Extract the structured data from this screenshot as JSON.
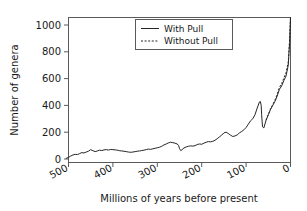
{
  "chart_data": {
    "type": "line",
    "title": "",
    "xlabel": "Millions of years before present",
    "ylabel": "Number of genera",
    "xlim": [
      500,
      0
    ],
    "ylim": [
      0,
      1060
    ],
    "x_ticks": [
      500,
      400,
      300,
      200,
      100,
      0
    ],
    "x_tick_labels": [
      "500",
      "400",
      "300",
      "200",
      "100",
      "0"
    ],
    "y_ticks": [
      0,
      200,
      400,
      600,
      800,
      1000
    ],
    "y_tick_labels": [
      "0",
      "200",
      "400",
      "600",
      "800",
      "1000"
    ],
    "x_axis_reversed": true,
    "grid": false,
    "legend_position": "top-center",
    "legend_entries": [
      "With Pull",
      "Without Pull"
    ],
    "series": [
      {
        "name": "With Pull",
        "style": "solid",
        "x": [
          505,
          500,
          495,
          490,
          485,
          480,
          475,
          470,
          465,
          460,
          455,
          450,
          445,
          440,
          435,
          430,
          425,
          420,
          415,
          410,
          405,
          400,
          395,
          390,
          385,
          380,
          375,
          370,
          365,
          360,
          355,
          350,
          345,
          340,
          335,
          330,
          325,
          320,
          315,
          310,
          305,
          300,
          295,
          290,
          285,
          280,
          275,
          270,
          265,
          260,
          255,
          252,
          250,
          247,
          245,
          240,
          235,
          230,
          225,
          220,
          215,
          210,
          205,
          200,
          195,
          190,
          185,
          180,
          175,
          170,
          165,
          160,
          155,
          150,
          145,
          140,
          135,
          130,
          125,
          120,
          115,
          110,
          105,
          100,
          95,
          90,
          85,
          80,
          75,
          70,
          68,
          66,
          65,
          63,
          60,
          55,
          50,
          45,
          40,
          35,
          30,
          25,
          20,
          15,
          10,
          5,
          2,
          0
        ],
        "y": [
          5,
          12,
          22,
          30,
          35,
          33,
          40,
          48,
          45,
          52,
          58,
          70,
          62,
          55,
          60,
          66,
          63,
          68,
          70,
          67,
          71,
          70,
          68,
          66,
          62,
          60,
          58,
          55,
          52,
          50,
          52,
          55,
          58,
          60,
          63,
          66,
          70,
          74,
          72,
          76,
          80,
          84,
          88,
          95,
          105,
          112,
          120,
          125,
          122,
          118,
          112,
          100,
          78,
          62,
          68,
          82,
          90,
          95,
          98,
          96,
          100,
          108,
          112,
          110,
          118,
          125,
          130,
          128,
          132,
          140,
          152,
          165,
          178,
          195,
          200,
          190,
          178,
          168,
          172,
          180,
          195,
          205,
          218,
          235,
          260,
          285,
          300,
          330,
          380,
          425,
          430,
          400,
          330,
          240,
          232,
          290,
          330,
          370,
          400,
          430,
          470,
          520,
          545,
          585,
          620,
          700,
          870,
          1055
        ],
        "description": "Sepkoski-style marine genus diversity curve with the Pull of the Recent applied"
      },
      {
        "name": "Without Pull",
        "style": "dashed",
        "x": [
          55,
          50,
          45,
          40,
          35,
          30,
          25,
          20,
          15,
          10,
          5,
          2,
          0
        ],
        "y": [
          290,
          332,
          374,
          406,
          440,
          482,
          534,
          562,
          604,
          645,
          725,
          890,
          1060
        ],
        "description": "Same diversity curve with the Pull of the Recent correction removed; diverges slightly above the solid curve over the last ~55 Myr"
      }
    ],
    "annotations": [
      {
        "label": "end-Permian drop",
        "x": 250,
        "y": 62
      },
      {
        "label": "end-Cretaceous drop",
        "x": 65,
        "y": 232
      }
    ]
  },
  "legend": {
    "items": [
      {
        "label": "With Pull",
        "style": "solid"
      },
      {
        "label": "Without Pull",
        "style": "dashed"
      }
    ]
  },
  "axes": {
    "x_title": "Millions of years before present",
    "y_title": "Number of genera"
  }
}
